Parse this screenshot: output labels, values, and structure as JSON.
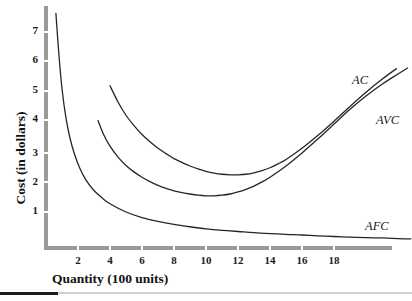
{
  "chart_data": {
    "type": "line",
    "title": "",
    "xlabel": "Quantity (100 units)",
    "ylabel": "Cost (in dollars)",
    "xlim": [
      0,
      23
    ],
    "ylim": [
      0,
      8
    ],
    "xticks": [
      2,
      4,
      6,
      8,
      10,
      12,
      14,
      16,
      18
    ],
    "yticks": [
      1,
      2,
      3,
      4,
      5,
      6,
      7
    ],
    "grid": false,
    "legend_position": "inline-right-of-curves",
    "curve_color": "#262626",
    "axis_color": "#9a9a9a",
    "series": [
      {
        "name": "AFC",
        "label": "AFC",
        "points": [
          [
            0.62,
            7.95
          ],
          [
            0.8,
            6.6
          ],
          [
            1.0,
            5.4
          ],
          [
            1.25,
            4.4
          ],
          [
            1.5,
            3.72
          ],
          [
            1.8,
            3.15
          ],
          [
            2.1,
            2.72
          ],
          [
            2.5,
            2.3
          ],
          [
            3.0,
            1.95
          ],
          [
            3.5,
            1.7
          ],
          [
            4.0,
            1.5
          ],
          [
            5.0,
            1.22
          ],
          [
            6.0,
            1.03
          ],
          [
            7.0,
            0.9
          ],
          [
            8.0,
            0.8
          ],
          [
            9.0,
            0.72
          ],
          [
            10.0,
            0.65
          ],
          [
            11.0,
            0.6
          ],
          [
            12.0,
            0.56
          ],
          [
            13.0,
            0.52
          ],
          [
            14.0,
            0.49
          ],
          [
            15.0,
            0.46
          ],
          [
            16.0,
            0.44
          ],
          [
            17.0,
            0.41
          ],
          [
            18.0,
            0.39
          ],
          [
            19.0,
            0.37
          ],
          [
            20.0,
            0.35
          ],
          [
            21.0,
            0.34
          ],
          [
            22.0,
            0.32
          ],
          [
            22.8,
            0.31
          ]
        ]
      },
      {
        "name": "AVC",
        "label": "AVC",
        "points": [
          [
            3.25,
            4.32
          ],
          [
            3.6,
            3.85
          ],
          [
            4.0,
            3.45
          ],
          [
            4.5,
            3.08
          ],
          [
            5.0,
            2.8
          ],
          [
            5.5,
            2.58
          ],
          [
            6.0,
            2.4
          ],
          [
            6.5,
            2.25
          ],
          [
            7.0,
            2.12
          ],
          [
            7.5,
            2.02
          ],
          [
            8.0,
            1.94
          ],
          [
            8.5,
            1.88
          ],
          [
            9.0,
            1.83
          ],
          [
            9.5,
            1.79
          ],
          [
            10.0,
            1.77
          ],
          [
            10.5,
            1.77
          ],
          [
            11.0,
            1.79
          ],
          [
            11.5,
            1.83
          ],
          [
            12.0,
            1.9
          ],
          [
            12.5,
            1.99
          ],
          [
            13.0,
            2.1
          ],
          [
            13.5,
            2.24
          ],
          [
            14.0,
            2.4
          ],
          [
            15.0,
            2.78
          ],
          [
            16.0,
            3.22
          ],
          [
            17.0,
            3.7
          ],
          [
            18.0,
            4.2
          ],
          [
            19.0,
            4.7
          ],
          [
            20.0,
            5.15
          ],
          [
            21.0,
            5.55
          ],
          [
            22.0,
            5.9
          ],
          [
            22.6,
            6.1
          ]
        ]
      },
      {
        "name": "AC",
        "label": "AC",
        "points": [
          [
            4.0,
            5.5
          ],
          [
            4.5,
            4.95
          ],
          [
            5.0,
            4.5
          ],
          [
            5.5,
            4.15
          ],
          [
            6.0,
            3.85
          ],
          [
            6.5,
            3.6
          ],
          [
            7.0,
            3.38
          ],
          [
            7.5,
            3.2
          ],
          [
            8.0,
            3.03
          ],
          [
            8.5,
            2.9
          ],
          [
            9.0,
            2.78
          ],
          [
            9.5,
            2.68
          ],
          [
            10.0,
            2.6
          ],
          [
            10.5,
            2.54
          ],
          [
            11.0,
            2.5
          ],
          [
            11.5,
            2.48
          ],
          [
            12.0,
            2.48
          ],
          [
            12.5,
            2.5
          ],
          [
            13.0,
            2.55
          ],
          [
            13.5,
            2.62
          ],
          [
            14.0,
            2.72
          ],
          [
            14.5,
            2.85
          ],
          [
            15.0,
            3.0
          ],
          [
            16.0,
            3.38
          ],
          [
            17.0,
            3.82
          ],
          [
            18.0,
            4.3
          ],
          [
            19.0,
            4.8
          ],
          [
            20.0,
            5.28
          ],
          [
            21.0,
            5.72
          ],
          [
            21.9,
            6.08
          ]
        ]
      }
    ]
  },
  "axes": {
    "x_title": "Quantity (100 units)",
    "y_title": "Cost (in dollars)",
    "x_tick_labels": [
      "2",
      "4",
      "6",
      "8",
      "10",
      "12",
      "14",
      "16",
      "18"
    ],
    "y_tick_labels": [
      "7",
      "6",
      "5",
      "4",
      "3",
      "2",
      "1"
    ]
  },
  "labels": {
    "ac": "AC",
    "avc": "AVC",
    "afc": "AFC"
  }
}
